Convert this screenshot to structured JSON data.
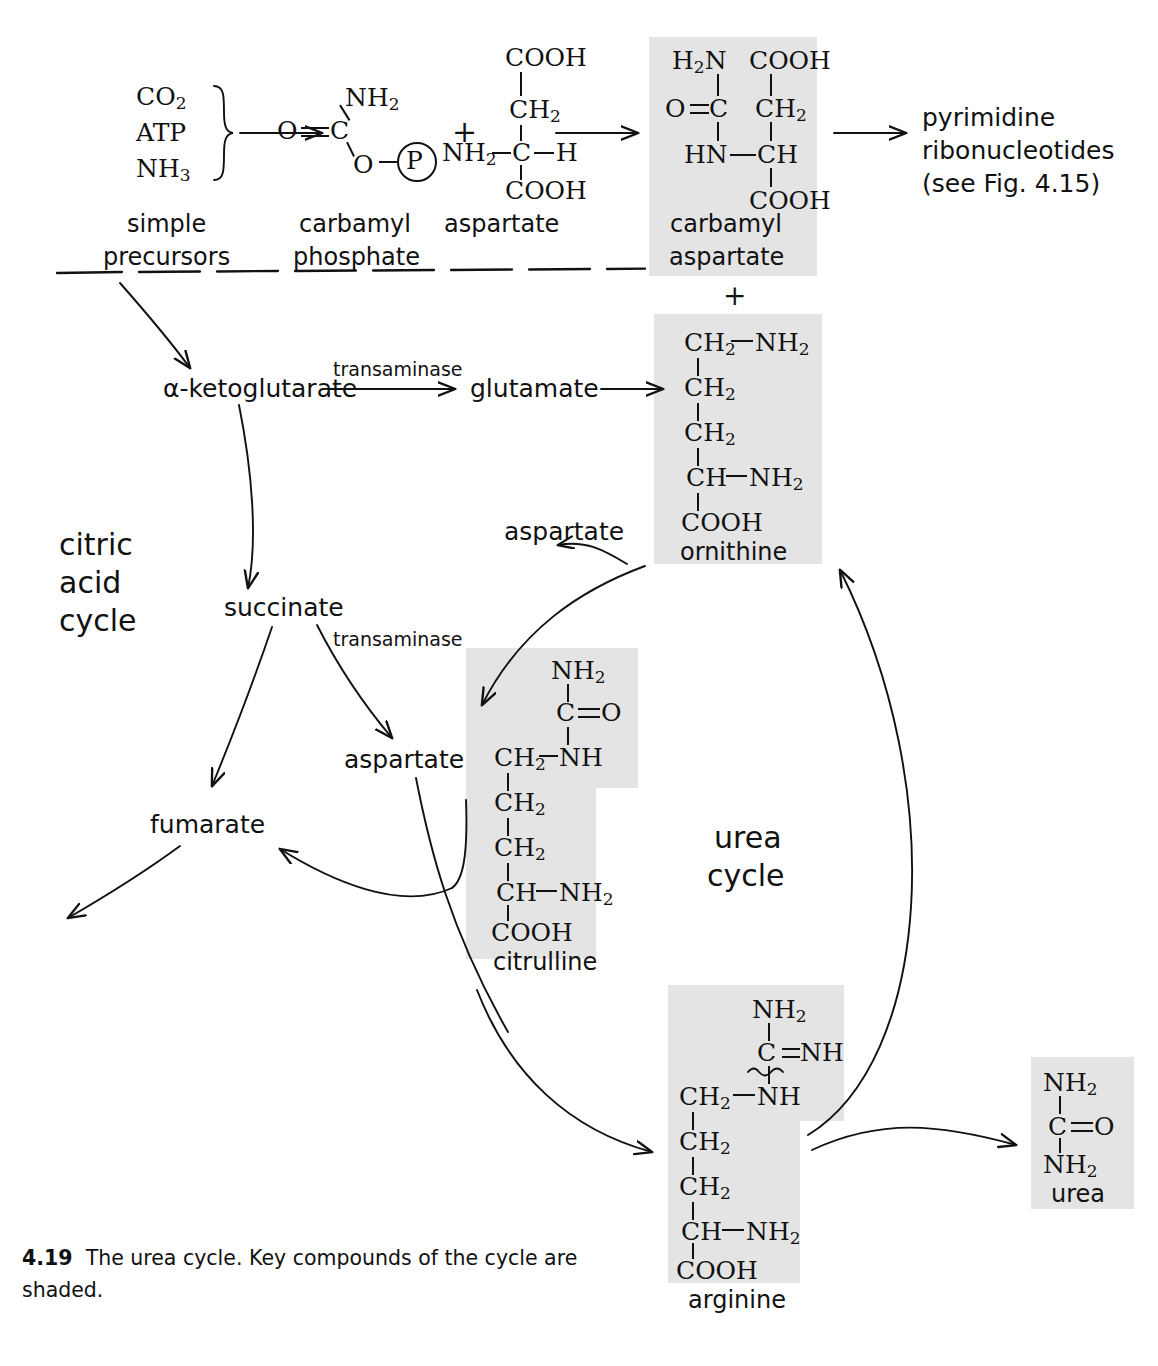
{
  "figure": {
    "number": "4.19",
    "caption_line1": "The urea cycle. Key compounds of the cycle are",
    "caption_line2": "shaded.",
    "shade_color": "#e4e4e4",
    "ink_color": "#111111"
  },
  "cycle_labels": {
    "citric_acid_cycle": [
      "citric",
      "acid",
      "cycle"
    ],
    "urea_cycle": [
      "urea",
      "cycle"
    ]
  },
  "precursors": {
    "items": [
      "CO₂",
      "ATP",
      "NH₃"
    ],
    "label_line1": "simple",
    "label_line2": "precursors"
  },
  "compounds": {
    "carbamyl_phosphate": {
      "name_line1": "carbamyl",
      "name_line2": "phosphate",
      "atoms": [
        "NH₂",
        "O",
        "C",
        "O",
        "P"
      ],
      "shaded": false
    },
    "aspartate_structure": {
      "name": "aspartate",
      "atoms": [
        "COOH",
        "CH₂",
        "NH₂",
        "C",
        "H",
        "COOH"
      ],
      "shaded": false
    },
    "carbamyl_aspartate": {
      "name_line1": "carbamyl",
      "name_line2": "aspartate",
      "atoms": [
        "H₂N",
        "COOH",
        "O",
        "C",
        "CH₂",
        "HN",
        "CH",
        "COOH"
      ],
      "shaded": true
    },
    "ornithine": {
      "name": "ornithine",
      "atoms": [
        "CH₂",
        "NH₂",
        "CH₂",
        "CH₂",
        "CH",
        "NH₂",
        "COOH"
      ],
      "shaded": true
    },
    "citrulline": {
      "name": "citrulline",
      "atoms": [
        "NH₂",
        "C",
        "O",
        "CH₂",
        "NH",
        "CH₂",
        "CH₂",
        "CH",
        "NH₂",
        "COOH"
      ],
      "shaded": true
    },
    "arginine": {
      "name": "arginine",
      "atoms": [
        "NH₂",
        "C",
        "NH",
        "CH₂",
        "NH",
        "CH₂",
        "CH₂",
        "CH",
        "NH₂",
        "COOH"
      ],
      "shaded": true
    },
    "urea": {
      "name": "urea",
      "atoms": [
        "NH₂",
        "C",
        "O",
        "NH₂"
      ],
      "shaded": true
    }
  },
  "nodes": {
    "alpha_ketoglutarate": "α-ketoglutarate",
    "glutamate": "glutamate",
    "succinate": "succinate",
    "fumarate": "fumarate",
    "aspartate_mid": "aspartate",
    "aspartate_upper": "aspartate"
  },
  "enzymes": {
    "transaminase_top": "transaminase",
    "transaminase_mid": "transaminase"
  },
  "products": {
    "pyrimidine_line1": "pyrimidine",
    "pyrimidine_line2": "ribonucleotides",
    "pyrimidine_line3": "(see Fig. 4.15)"
  },
  "operators": {
    "plus_top": "+",
    "plus_mid": "+"
  }
}
